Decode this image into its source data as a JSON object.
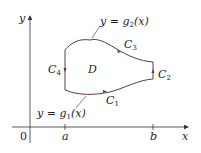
{
  "diagram": {
    "axes": {
      "x_label": "x",
      "y_label": "y",
      "origin_label": "0",
      "tick_a": "a",
      "tick_b": "b"
    },
    "region_label": "D",
    "curves": {
      "C1": "C",
      "C1_sub": "1",
      "C2": "C",
      "C2_sub": "2",
      "C3": "C",
      "C3_sub": "3",
      "C4": "C",
      "C4_sub": "4"
    },
    "annotations": {
      "upper": "y = g",
      "upper_sub": "2",
      "upper_arg": "(x)",
      "lower": "y = g",
      "lower_sub": "1",
      "lower_arg": "(x)"
    },
    "colors": {
      "curve": "#5a3a4a",
      "axis": "#333333"
    }
  }
}
